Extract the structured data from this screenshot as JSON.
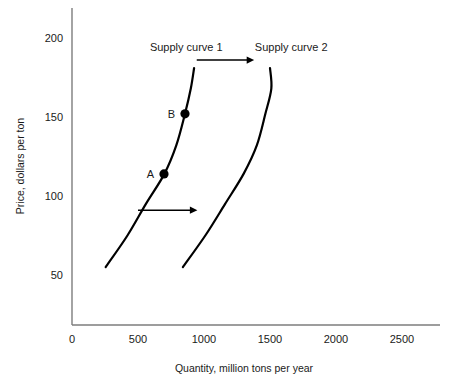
{
  "chart_data": {
    "type": "line",
    "title": "",
    "xlabel": "Quantity, million tons per year",
    "ylabel": "Price, dollars per ton",
    "xlim": [
      0,
      2700
    ],
    "ylim": [
      0,
      215
    ],
    "grid": false,
    "legend": "none",
    "xticks": [
      {
        "value": 0,
        "label": "0"
      },
      {
        "value": 500,
        "label": "500"
      },
      {
        "value": 1000,
        "label": "1000"
      },
      {
        "value": 1500,
        "label": "1500"
      },
      {
        "value": 2000,
        "label": "2000"
      },
      {
        "value": 2500,
        "label": "2500"
      }
    ],
    "yticks": [
      {
        "value": 50,
        "label": "50"
      },
      {
        "value": 100,
        "label": "100"
      },
      {
        "value": 150,
        "label": "150"
      },
      {
        "value": 200,
        "label": "200"
      }
    ],
    "series": [
      {
        "name": "Supply curve 1",
        "label": "Supply curve 1",
        "label_x": 590,
        "label_y": 192,
        "points": [
          {
            "x": 255,
            "y": 55
          },
          {
            "x": 420,
            "y": 75
          },
          {
            "x": 560,
            "y": 95
          },
          {
            "x": 700,
            "y": 114
          },
          {
            "x": 790,
            "y": 132
          },
          {
            "x": 856,
            "y": 152
          },
          {
            "x": 900,
            "y": 168
          },
          {
            "x": 925,
            "y": 181
          }
        ]
      },
      {
        "name": "Supply curve 2",
        "label": "Supply curve 2",
        "label_x": 1385,
        "label_y": 192,
        "points": [
          {
            "x": 840,
            "y": 55
          },
          {
            "x": 1010,
            "y": 75
          },
          {
            "x": 1160,
            "y": 95
          },
          {
            "x": 1300,
            "y": 114
          },
          {
            "x": 1400,
            "y": 132
          },
          {
            "x": 1465,
            "y": 152
          },
          {
            "x": 1510,
            "y": 168
          },
          {
            "x": 1500,
            "y": 181
          }
        ]
      }
    ],
    "points": [
      {
        "name": "A",
        "label": "A",
        "x": 697,
        "y": 114
      },
      {
        "name": "B",
        "label": "B",
        "x": 856,
        "y": 152
      }
    ],
    "annotations": [
      {
        "name": "shift-arrow-upper",
        "x_start": 945,
        "x_end": 1380,
        "y": 186
      },
      {
        "name": "shift-arrow-lower",
        "x_start": 500,
        "x_end": 950,
        "y": 91
      }
    ]
  }
}
